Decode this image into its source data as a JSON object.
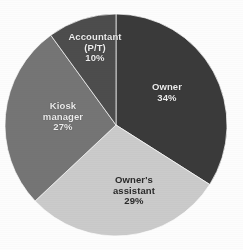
{
  "chart_data": {
    "type": "pie",
    "title": "",
    "subtitle": "",
    "xlabel": "",
    "ylabel": "",
    "legend": "none",
    "grid": false,
    "labels_inside_slices": true,
    "categories": [
      "Owner",
      "Owner's assistant",
      "Kiosk manager",
      "Accountant (P/T)"
    ],
    "values": [
      34,
      29,
      27,
      10
    ],
    "value_suffix": "%",
    "total": 100,
    "start_angle_deg": 0,
    "direction": "clockwise",
    "background_color": "#fdfdfd",
    "slices": [
      {
        "name": "Owner",
        "label_lines": [
          "Owner",
          "34%"
        ],
        "value": 34,
        "value_text": "34%",
        "color": "#3a3a3a",
        "label_color": "#efefef",
        "start_deg": 0,
        "end_deg": 122.4
      },
      {
        "name": "Owner's assistant",
        "label_lines": [
          "Owner's",
          "assistant",
          "29%"
        ],
        "value": 29,
        "value_text": "29%",
        "color": "#cbcbcb",
        "label_color": "#2a2a2a",
        "start_deg": 122.4,
        "end_deg": 226.8
      },
      {
        "name": "Kiosk manager",
        "label_lines": [
          "Kiosk",
          "manager",
          "27%"
        ],
        "value": 27,
        "value_text": "27%",
        "color": "#757575",
        "label_color": "#efefef",
        "start_deg": 226.8,
        "end_deg": 324.0
      },
      {
        "name": "Accountant (P/T)",
        "label_lines": [
          "Accountant",
          "(P/T)",
          "10%"
        ],
        "value": 10,
        "value_text": "10%",
        "color": "#4d4d4d",
        "label_color": "#efefef",
        "start_deg": 324.0,
        "end_deg": 360.0
      }
    ],
    "geometry": {
      "center_x": 116,
      "center_y": 125,
      "radius": 111
    }
  }
}
